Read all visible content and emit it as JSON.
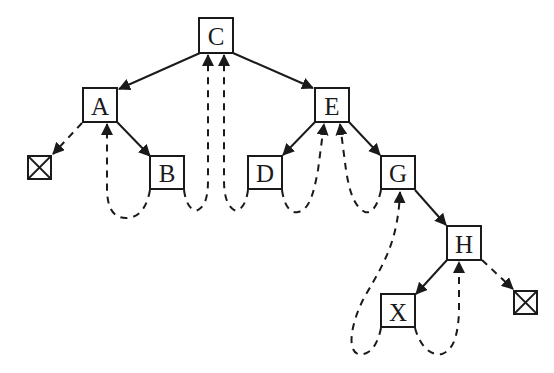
{
  "diagram": {
    "colors": {
      "stroke": "#1a1a1a",
      "background": "#ffffff"
    },
    "nodes": [
      {
        "id": "C",
        "label": "C",
        "x": 199,
        "y": 18,
        "w": 34,
        "h": 35
      },
      {
        "id": "A",
        "label": "A",
        "x": 83,
        "y": 88,
        "w": 34,
        "h": 34
      },
      {
        "id": "E",
        "label": "E",
        "x": 315,
        "y": 88,
        "w": 34,
        "h": 34
      },
      {
        "id": "B",
        "label": "B",
        "x": 150,
        "y": 156,
        "w": 34,
        "h": 33
      },
      {
        "id": "D",
        "label": "D",
        "x": 248,
        "y": 156,
        "w": 34,
        "h": 33
      },
      {
        "id": "G",
        "label": "G",
        "x": 381,
        "y": 156,
        "w": 34,
        "h": 33
      },
      {
        "id": "H",
        "label": "H",
        "x": 447,
        "y": 226,
        "w": 34,
        "h": 34
      },
      {
        "id": "X",
        "label": "X",
        "x": 381,
        "y": 294,
        "w": 34,
        "h": 33
      }
    ],
    "null_nodes": [
      {
        "id": "null-left",
        "x": 28,
        "y": 156,
        "w": 23,
        "h": 23
      },
      {
        "id": "null-right",
        "x": 514,
        "y": 291,
        "w": 23,
        "h": 23
      }
    ],
    "child_edges": [
      {
        "from": "C",
        "to": "A"
      },
      {
        "from": "C",
        "to": "E"
      },
      {
        "from": "A",
        "to": "B"
      },
      {
        "from": "E",
        "to": "D"
      },
      {
        "from": "E",
        "to": "G"
      },
      {
        "from": "G",
        "to": "H"
      },
      {
        "from": "H",
        "to": "X"
      }
    ],
    "thread_edges": [
      {
        "from": "A",
        "to": "null-left",
        "kind": "left-thread"
      },
      {
        "from": "B",
        "to": "A",
        "kind": "left-thread"
      },
      {
        "from": "B",
        "to": "C",
        "kind": "right-thread"
      },
      {
        "from": "D",
        "to": "C",
        "kind": "left-thread"
      },
      {
        "from": "D",
        "to": "E",
        "kind": "right-thread"
      },
      {
        "from": "G",
        "to": "E",
        "kind": "left-thread"
      },
      {
        "from": "X",
        "to": "G",
        "kind": "left-thread"
      },
      {
        "from": "X",
        "to": "H",
        "kind": "right-thread"
      },
      {
        "from": "H",
        "to": "null-right",
        "kind": "right-thread"
      }
    ]
  }
}
